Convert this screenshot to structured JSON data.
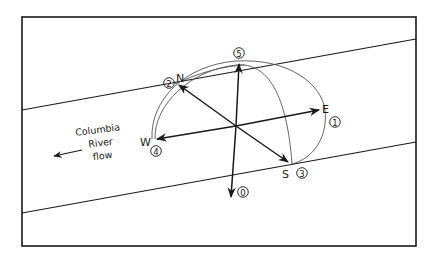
{
  "diagram": {
    "river_label_line1": "Columbia",
    "river_label_line2": "River",
    "river_label_line3": "flow",
    "directions": {
      "north": "N",
      "south": "S",
      "east": "E",
      "west": "W"
    },
    "markers": {
      "m0": "0",
      "m1": "1",
      "m2": "2",
      "m3": "3",
      "m4": "4",
      "m5": "5"
    },
    "colors": {
      "line": "#1a1a1a",
      "arc": "#444444",
      "background": "#ffffff"
    }
  }
}
